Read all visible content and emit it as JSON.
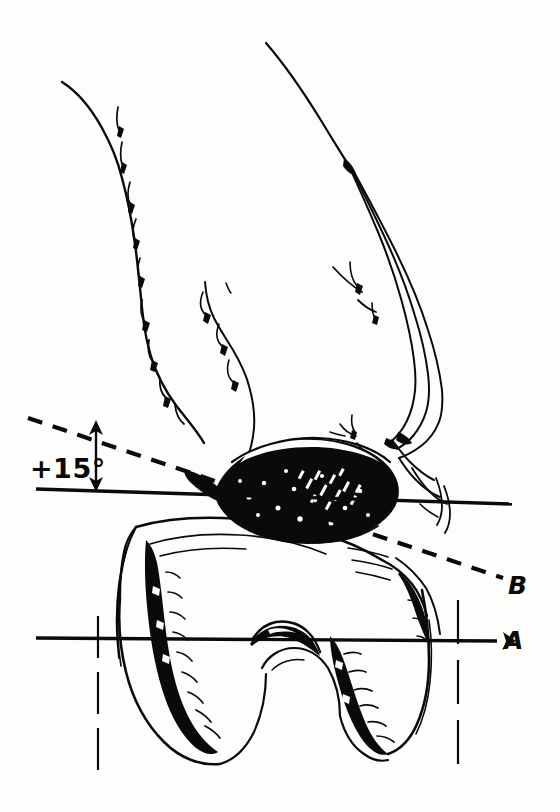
{
  "figure": {
    "kind": "anatomical-line-drawing",
    "background_color": "#fdfdfc",
    "ink_color": "#0a0a0a",
    "width": 560,
    "height": 812
  },
  "annotations": {
    "angle": {
      "text": "+15°",
      "x": 52,
      "y": 470
    },
    "line_a": {
      "label": "A",
      "label_x": 512,
      "label_y": 650,
      "style": "solid",
      "x1": 36,
      "y1": 638,
      "x2": 497,
      "y2": 641
    },
    "line_b": {
      "label": "B",
      "label_x": 512,
      "label_y": 588,
      "style": "dashed",
      "x1": 28,
      "y1": 418,
      "x2": 503,
      "y2": 578
    },
    "line_horizontal_upper": {
      "label": "",
      "style": "solid",
      "x1": 36,
      "y1": 489,
      "x2": 512,
      "y2": 504
    },
    "angle_arrow": {
      "x": 96,
      "y_top": 424,
      "y_bottom": 489,
      "double_headed": true
    },
    "vertical_guide_left": {
      "x": 98,
      "y1": 616,
      "y2": 772,
      "style": "dashed"
    },
    "vertical_guide_right": {
      "x": 458,
      "y1": 600,
      "y2": 776,
      "style": "dashed"
    }
  },
  "structures": {
    "upper_bone": "femur shaft and condylar flare outline with trabecular barb marks",
    "meniscus": "solid black lens-shaped meniscus with white speckle texture",
    "lower_bone": "femoral condyles with intercondylar notch and hatched shading",
    "fiber_bundles": "three tapering parallel lines on upper right representing collateral fibers"
  }
}
